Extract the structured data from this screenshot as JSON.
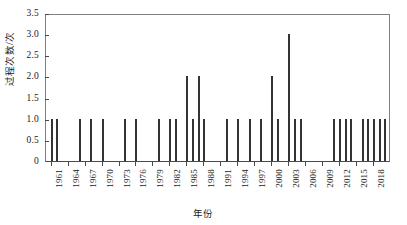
{
  "chart_data": {
    "type": "bar",
    "title": "",
    "xlabel": "年份",
    "ylabel": "过程次数/次",
    "ylim": [
      0,
      3.5
    ],
    "xlim": [
      1960,
      2021
    ],
    "grid": false,
    "legend": null,
    "y_ticks": [
      "0",
      "0.5",
      "1.0",
      "1.5",
      "2.0",
      "2.5",
      "3.0",
      "3.5"
    ],
    "y_tick_values": [
      0,
      0.5,
      1.0,
      1.5,
      2.0,
      2.5,
      3.0,
      3.5
    ],
    "x_ticks": [
      "1961",
      "1964",
      "1967",
      "1970",
      "1973",
      "1976",
      "1979",
      "1982",
      "1985",
      "1988",
      "1991",
      "1994",
      "1997",
      "2000",
      "2003",
      "2006",
      "2009",
      "2012",
      "2015",
      "2018"
    ],
    "x_tick_values": [
      1961,
      1964,
      1967,
      1970,
      1973,
      1976,
      1979,
      1982,
      1985,
      1988,
      1991,
      1994,
      1997,
      2000,
      2003,
      2006,
      2009,
      2012,
      2015,
      2018
    ],
    "bar_color": "#333333",
    "categories": [
      1961,
      1962,
      1966,
      1968,
      1970,
      1974,
      1976,
      1980,
      1982,
      1983,
      1985,
      1986,
      1987,
      1988,
      1992,
      1994,
      1996,
      1998,
      2000,
      2001,
      2003,
      2004,
      2005,
      2011,
      2012,
      2013,
      2014,
      2016,
      2017,
      2018,
      2019,
      2020
    ],
    "values": [
      1,
      1,
      1,
      1,
      1,
      1,
      1,
      1,
      1,
      1,
      2,
      1,
      2,
      1,
      1,
      1,
      1,
      1,
      2,
      1,
      3,
      1,
      1,
      1,
      1,
      1,
      1,
      1,
      1,
      1,
      1,
      1
    ]
  }
}
